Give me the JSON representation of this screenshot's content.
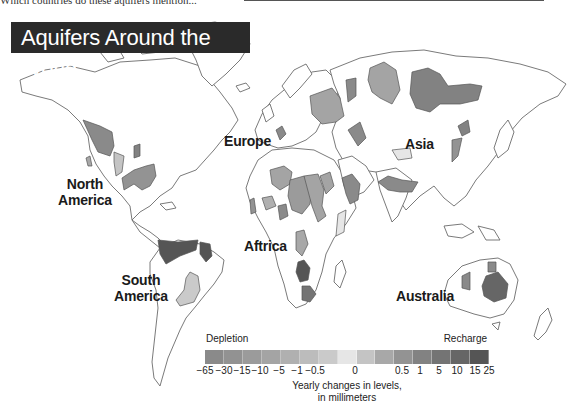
{
  "header": {
    "cutoff_question": "Which countries do these aquifers mention..."
  },
  "map": {
    "title": "Aquifers Around the World",
    "labels": {
      "north_america": [
        "North",
        "America"
      ],
      "south_america": [
        "South",
        "America"
      ],
      "europe": "Europe",
      "africa": "Aftrica",
      "asia": "Asia",
      "australia": "Australia"
    },
    "colors": {
      "land_fill": "#ffffff",
      "land_stroke": "#6b6b6b",
      "title_bg": "#2a2a2a",
      "title_text": "#ffffff"
    }
  },
  "legend": {
    "left_label": "Depletion",
    "right_label": "Recharge",
    "ticks": [
      "-65",
      "-30",
      "-15",
      "-10",
      "-5",
      "-1",
      "-0.5",
      "0",
      "0.5",
      "1",
      "5",
      "10",
      "15",
      "25"
    ],
    "swatches": [
      "#8a8a8a",
      "#929292",
      "#9b9b9b",
      "#a4a4a4",
      "#b0b0b0",
      "#bcbcbc",
      "#cacaca",
      "#e6e6e6",
      "#c4c4c4",
      "#a8a8a8",
      "#939393",
      "#828282",
      "#747474",
      "#666666",
      "#555555"
    ],
    "caption_line1": "Yearly changes in levels,",
    "caption_line2": "in millimeters"
  },
  "chart_data": {
    "type": "heatmap",
    "title": "Aquifers Around the World",
    "legend_title": "Yearly changes in levels, in millimeters",
    "scale_min_label": "Depletion",
    "scale_max_label": "Recharge",
    "scale_breaks": [
      -65,
      -30,
      -15,
      -10,
      -5,
      -1,
      -0.5,
      0,
      0.5,
      1,
      5,
      10,
      15,
      25
    ],
    "regions": [
      "North America",
      "South America",
      "Europe",
      "Aftrica",
      "Asia",
      "Australia"
    ]
  }
}
